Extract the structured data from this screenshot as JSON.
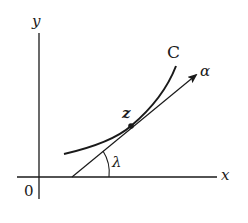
{
  "diagram": {
    "type": "complex-plane tangent diagram",
    "labels": {
      "y_axis": "y",
      "x_axis": "x",
      "origin": "0",
      "curve": "C",
      "point": "z",
      "direction": "α",
      "angle": "λ"
    },
    "colors": {
      "ink": "#1a1a1a",
      "background": "#ffffff"
    }
  }
}
